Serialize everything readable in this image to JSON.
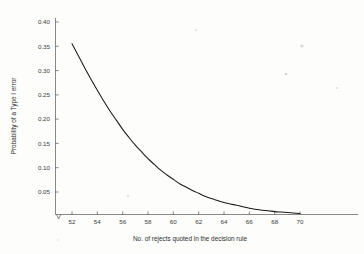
{
  "chart_data": {
    "type": "line",
    "title": "",
    "subtitle": "",
    "xlabel": "No. of rejects quoted in the decision rule",
    "ylabel": "Probability of a Type I error",
    "xlim": [
      51,
      71.8
    ],
    "ylim": [
      0,
      0.425
    ],
    "grid": false,
    "legend": null,
    "xticks": [
      52,
      54,
      56,
      58,
      60,
      62,
      64,
      66,
      68,
      70
    ],
    "xtick_labels": [
      "52",
      "54",
      "56",
      "58",
      "60",
      "62",
      "64",
      "66",
      "68",
      "70"
    ],
    "yticks": [
      0.05,
      0.1,
      0.15,
      0.2,
      0.25,
      0.3,
      0.35,
      0.4
    ],
    "ytick_labels": [
      "0.05",
      "0.10",
      "0.15",
      "0.20",
      "0.25",
      "0.30",
      "0.35",
      "0.40"
    ],
    "series": [
      {
        "name": "Probability of a Type I error",
        "color": "#1a1a1a",
        "x": [
          52,
          52.5,
          53,
          53.5,
          54,
          54.5,
          55,
          55.5,
          56,
          56.5,
          57,
          57.5,
          58,
          58.5,
          59,
          59.5,
          60,
          60.5,
          61,
          61.5,
          62,
          62.5,
          63,
          63.5,
          64,
          64.5,
          65,
          65.5,
          66,
          66.5,
          67,
          67.5,
          68,
          68.5,
          69,
          69.5,
          70
        ],
        "y": [
          0.355,
          0.33,
          0.305,
          0.281,
          0.258,
          0.236,
          0.215,
          0.196,
          0.177,
          0.16,
          0.144,
          0.13,
          0.116,
          0.104,
          0.092,
          0.082,
          0.073,
          0.064,
          0.057,
          0.05,
          0.044,
          0.038,
          0.033,
          0.029,
          0.025,
          0.022,
          0.019,
          0.016,
          0.013,
          0.011,
          0.009,
          0.008,
          0.006,
          0.005,
          0.004,
          0.003,
          0.002
        ]
      }
    ],
    "annotations": []
  },
  "figure": {
    "axis_color": "#555555",
    "background": "#fdfdfc"
  }
}
